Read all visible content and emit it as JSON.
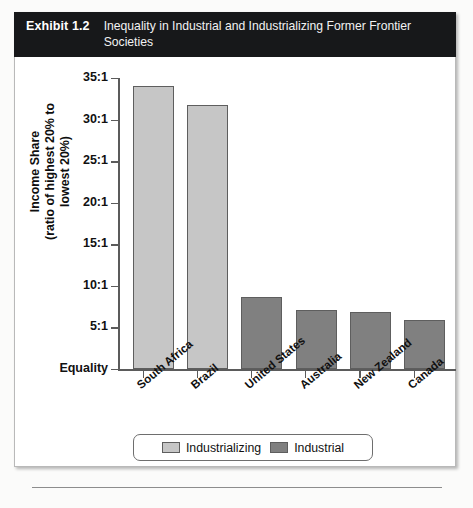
{
  "exhibit": {
    "label": "Exhibit 1.2",
    "title": "Inequality in Industrial and Industrializing Former Frontier Societies"
  },
  "chart_data": {
    "type": "bar",
    "title": "Inequality in Industrial and Industrializing Former Frontier Societies",
    "xlabel": "",
    "ylabel": "Income Share (ratio of highest 20% to lowest 20%)",
    "ylabel_line1": "Income Share",
    "ylabel_line2": "(ratio of highest 20% to lowest 20%)",
    "ylim": [
      0,
      35
    ],
    "grid": false,
    "categories": [
      "South Africa",
      "Brazil",
      "United States",
      "Australia",
      "New Zealand",
      "Canada"
    ],
    "values": [
      34.0,
      31.7,
      8.6,
      7.1,
      6.9,
      5.9
    ],
    "groups": [
      "Industrializing",
      "Industrializing",
      "Industrial",
      "Industrial",
      "Industrial",
      "Industrial"
    ],
    "ytick_values": [
      0,
      5,
      10,
      15,
      20,
      25,
      30,
      35
    ],
    "ytick_labels": [
      "Equality",
      "5:1",
      "10:1",
      "15:1",
      "20:1",
      "25:1",
      "30:1",
      "35:1"
    ],
    "legend": {
      "position": "bottom",
      "entries": [
        {
          "label": "Industrializing",
          "color": "#c6c6c6"
        },
        {
          "label": "Industrial",
          "color": "#808080"
        }
      ]
    },
    "colors": {
      "industrializing": "#c6c6c6",
      "industrial": "#808080",
      "bar_border": "#5e5e5e",
      "axis": "#5b5b5b",
      "header_background": "#17181a",
      "header_text": "#ffffff"
    }
  }
}
